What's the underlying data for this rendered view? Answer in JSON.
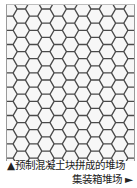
{
  "figure": {
    "name": "hexagonal-paving-pattern",
    "stroke_color": "#4a4a4a",
    "fill_color": "#f7f7f7"
  },
  "captions": {
    "line1": "▲预制混凝土块拼成的堆场",
    "line2": "集装箱堆场 ►"
  }
}
